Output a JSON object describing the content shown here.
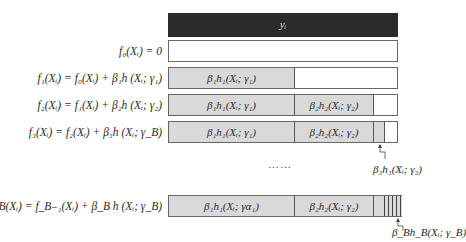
{
  "target": {
    "label": "y_i",
    "display": "yᵢ"
  },
  "equations": [
    {
      "id": "f0",
      "text": "f₀(Xᵢ) = 0"
    },
    {
      "id": "f1",
      "text": "f₁(Xᵢ) = f₀(Xᵢ) + β₁h (Xᵢ; γ₁)"
    },
    {
      "id": "f2",
      "text": "f₂(Xᵢ) = f₁(Xᵢ) + β₂h (Xᵢ; γ₂)"
    },
    {
      "id": "f3",
      "text": "f₃(Xᵢ) = f₂(Xᵢ) + β₃h (Xᵢ; γ_B)"
    },
    {
      "id": "fB",
      "text": "f_B(Xᵢ) = f_{B−1}(Xᵢ) + β_B h (Xᵢ; γ_B)"
    }
  ],
  "equation_display": {
    "f0": "f₀(Xᵢ) = 0",
    "f1": "f₁(Xᵢ) = f₀(Xᵢ) + β₁h (Xᵢ; γ₁)",
    "f2": "f₂(Xᵢ) = f₁(Xᵢ) + β₂h (Xᵢ; γ₂)",
    "f3": "f₃(Xᵢ) = f₂(Xᵢ) + β₃h (Xᵢ; γ_B)",
    "fB": "f_B(Xᵢ) = f_B₋₁(Xᵢ) + β_B h (Xᵢ; γ_B)"
  },
  "segments": {
    "s1": "β₁h₁(Xᵢ; γ₁)",
    "s2": "β₂h₂(Xᵢ; γ₂)",
    "s1_last": "β₁h₁(Xᵢ; γα₁)"
  },
  "annotations": {
    "a3": "β₃h₃(Xᵢ; γ₃)",
    "aB": "β_Bh_B(Xᵢ; γ_B)"
  },
  "ellipsis": "……",
  "colors": {
    "target_bar": "#2b2b2b",
    "segment_fill": "#d9d9d9",
    "border": "#666666"
  }
}
